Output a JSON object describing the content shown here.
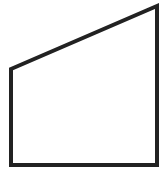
{
  "diagram": {
    "shape": "trapezoid",
    "stroke_color": "#222222",
    "fill_color": "#ffffff",
    "stroke_width": 4,
    "vertices": [
      {
        "name": "top-left",
        "x": 11,
        "y": 69
      },
      {
        "name": "top-right",
        "x": 157,
        "y": 6
      },
      {
        "name": "bottom-right",
        "x": 157,
        "y": 165
      },
      {
        "name": "bottom-left",
        "x": 11,
        "y": 165
      }
    ],
    "labels": []
  }
}
